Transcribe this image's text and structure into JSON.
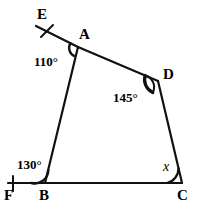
{
  "figure": {
    "type": "geometry-diagram",
    "stroke_color": "#111111",
    "background_color": "#ffffff",
    "stroke_width": 2
  },
  "points": {
    "A": {
      "label": "A",
      "x": 78,
      "y": 47,
      "label_x": 79,
      "label_y": 27
    },
    "B": {
      "label": "B",
      "x": 45,
      "y": 183,
      "label_x": 39,
      "label_y": 188
    },
    "C": {
      "label": "C",
      "x": 182,
      "y": 183,
      "label_x": 178,
      "label_y": 188
    },
    "D": {
      "label": "D",
      "x": 158,
      "y": 81,
      "label_x": 163,
      "label_y": 68
    },
    "E": {
      "label": "E",
      "x": 38,
      "y": 27,
      "label_x": 38,
      "label_y": 8
    },
    "F": {
      "label": "F",
      "x": 10,
      "y": 183,
      "label_x": 5,
      "label_y": 188
    }
  },
  "segments": [
    {
      "name": "segment-AB",
      "from": "A",
      "to": "B"
    },
    {
      "name": "segment-BC",
      "from": "B",
      "to": "C"
    },
    {
      "name": "segment-CD",
      "from": "C",
      "to": "D"
    },
    {
      "name": "segment-DA",
      "from": "D",
      "to": "A"
    },
    {
      "name": "ray-AE",
      "from": "A",
      "to": "E"
    },
    {
      "name": "ray-BF",
      "from": "B",
      "to": "F"
    }
  ],
  "tick_marks": [
    {
      "name": "tick-on-ray-AE",
      "x1": 42,
      "y1": 36,
      "x2": 52,
      "y2": 26
    },
    {
      "name": "tick-on-ray-BF",
      "x1": 13,
      "y1": 177,
      "x2": 13,
      "y2": 190
    }
  ],
  "angles": {
    "at_A": {
      "label": "110°",
      "value": 110,
      "unit": "degrees",
      "label_x": 35,
      "label_y": 55
    },
    "at_D": {
      "label": "145°",
      "value": 145,
      "unit": "degrees",
      "label_x": 114,
      "label_y": 91
    },
    "at_B": {
      "label": "130°",
      "value": 130,
      "unit": "degrees",
      "label_x": 18,
      "label_y": 158
    },
    "at_C": {
      "label": "x",
      "value": null,
      "unit": "degrees",
      "label_x": 162,
      "label_y": 160
    }
  }
}
